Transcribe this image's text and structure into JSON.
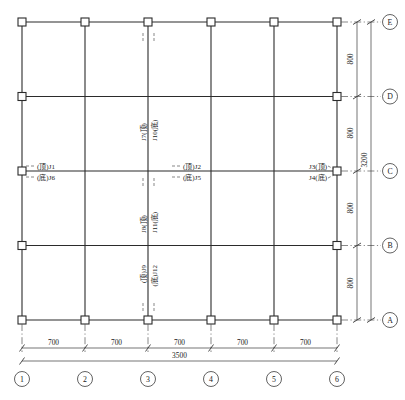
{
  "drawing": {
    "type": "structural-framing-plan",
    "title": "",
    "units_note": "",
    "horizontal_grids": {
      "labels": [
        "1",
        "2",
        "3",
        "4",
        "5",
        "6"
      ],
      "spans": [
        "700",
        "700",
        "700",
        "700",
        "700"
      ],
      "total": "3500"
    },
    "vertical_grids": {
      "labels": [
        "A",
        "B",
        "C",
        "D",
        "E"
      ],
      "spans": [
        "800",
        "800",
        "800",
        "800"
      ],
      "total": "3200"
    },
    "joint_labels": [
      {
        "id": "left-c-top",
        "text": "(顶)J1",
        "orientation": "horizontal"
      },
      {
        "id": "left-c-bottom",
        "text": "(底)J6",
        "orientation": "horizontal"
      },
      {
        "id": "mid-c-top",
        "text": "(顶)J2",
        "orientation": "horizontal"
      },
      {
        "id": "mid-c-bottom",
        "text": "(底)J5",
        "orientation": "horizontal"
      },
      {
        "id": "right-c-top",
        "text": "J3(顶)",
        "orientation": "horizontal"
      },
      {
        "id": "right-c-bottom",
        "text": "J4(底)",
        "orientation": "horizontal"
      },
      {
        "id": "upper-v-top",
        "text": "J7(顶)",
        "orientation": "vertical"
      },
      {
        "id": "upper-v-bottom",
        "text": "J10(底)",
        "orientation": "vertical"
      },
      {
        "id": "center-v-top",
        "text": "J8(顶)",
        "orientation": "vertical"
      },
      {
        "id": "center-v-bottom",
        "text": "J11(底)",
        "orientation": "vertical"
      },
      {
        "id": "lower-v-top",
        "text": "(顶)J9",
        "orientation": "vertical"
      },
      {
        "id": "lower-v-bottom",
        "text": "(底)J12",
        "orientation": "vertical"
      }
    ],
    "colors": {
      "line": "#2b2b2b",
      "dimension": "#3a3a3a",
      "leader": "#555555",
      "background": "#ffffff"
    }
  }
}
